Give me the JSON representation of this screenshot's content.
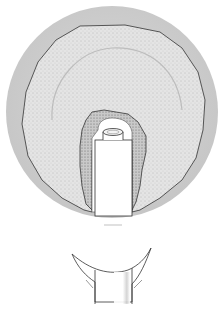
{
  "figure": {
    "views": [
      {
        "name": "occlusal-view",
        "description": "circular gum/bone area with implant abutment emerging from irregular tissue collar"
      },
      {
        "name": "cross-section-view",
        "description": "abutment post with flared gingival collar"
      }
    ],
    "caption_mark": "",
    "colors": {
      "background": "#ffffff",
      "outer_disc": "#cfcfcf",
      "tissue": "#dedede",
      "tissue_stipple": "#8a8a8a",
      "outline": "#333333",
      "abutment": "#ffffff"
    }
  }
}
